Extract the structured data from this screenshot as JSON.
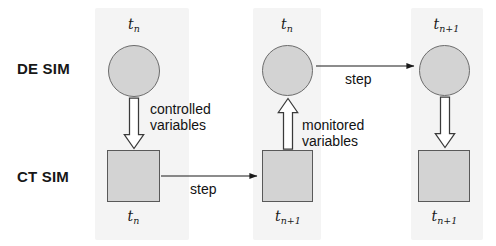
{
  "diagram": {
    "colors": {
      "shape_fill": "#d3d3d3",
      "shape_stroke": "#595959",
      "panel": "#f4f4f4",
      "text": "#121212"
    },
    "rows": [
      {
        "id": "de-sim",
        "label": "DE SIM",
        "shape": "circle"
      },
      {
        "id": "ct-sim",
        "label": "CT SIM",
        "shape": "square"
      }
    ],
    "columns": [
      {
        "id": "column-1",
        "de_time_label": "t",
        "de_time_sub": "n",
        "ct_time_label": "t",
        "ct_time_sub": "n"
      },
      {
        "id": "column-2",
        "de_time_label": "t",
        "de_time_sub": "n",
        "ct_time_label": "t",
        "ct_time_sub": "n+1"
      },
      {
        "id": "column-3",
        "de_time_label": "t",
        "de_time_sub": "n+1",
        "ct_time_label": "t",
        "ct_time_sub": "n+1"
      }
    ],
    "edges": [
      {
        "id": "controlled-variables",
        "label": "controlled\nvariables",
        "style": "hollow-block-arrow",
        "direction": "down",
        "from": "de-sim-node-1",
        "to": "ct-sim-node-1"
      },
      {
        "id": "monitored-variables",
        "label": "monitored\nvariables",
        "style": "hollow-block-arrow",
        "direction": "up",
        "from": "ct-sim-node-2",
        "to": "de-sim-node-2"
      },
      {
        "id": "controlled-variables-2",
        "label": "",
        "style": "hollow-block-arrow",
        "direction": "down",
        "from": "de-sim-node-3",
        "to": "ct-sim-node-3"
      },
      {
        "id": "ct-step",
        "label": "step",
        "style": "thin-line-arrow",
        "direction": "right",
        "from": "ct-sim-node-1",
        "to": "ct-sim-node-2"
      },
      {
        "id": "de-step",
        "label": "step",
        "style": "thin-line-arrow",
        "direction": "right",
        "from": "de-sim-node-2",
        "to": "de-sim-node-3"
      }
    ]
  }
}
